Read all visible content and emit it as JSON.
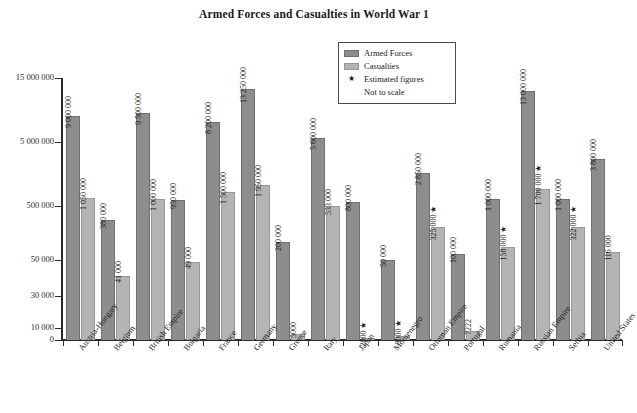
{
  "chart_data": {
    "type": "bar",
    "title": "Armed Forces and Casualties in World War 1",
    "xlabel": "",
    "ylabel": "",
    "grid": false,
    "legend_position": "top-center-right",
    "axis_note": "Not to scale",
    "y_ticks": [
      "0",
      "10 000",
      "30 000",
      "50 000",
      "500 000",
      "5 000 000",
      "15 000 000"
    ],
    "y_tick_values": [
      0,
      10000,
      30000,
      50000,
      500000,
      5000000,
      15000000
    ],
    "categories": [
      "Austria-Hungary",
      "Belgium",
      "British Empire",
      "Bulgaria",
      "France",
      "Germany",
      "Greece",
      "Italy",
      "Japan",
      "Montenegro",
      "Ottoman Empire",
      "Portugal",
      "Rumania",
      "Russian Empire",
      "Serbia",
      "United States"
    ],
    "series": [
      {
        "name": "Armed Forces",
        "color": "#8d8d8d",
        "values": [
          9000000,
          380000,
          9500000,
          950000,
          8200000,
          13250000,
          200000,
          5600000,
          800000,
          50000,
          2850000,
          100000,
          1000000,
          13000000,
          1000000,
          3800000
        ],
        "labels": [
          "9 000 000",
          "380 000",
          "9 500 000",
          "950 000",
          "8 200 000",
          "13 250 000",
          "200 000",
          "5 600 000",
          "800 000",
          "50 000",
          "2 850 000",
          "100 000",
          "1 000 000",
          "13 000 000",
          "1 000 000",
          "3 800 000"
        ],
        "estimated": [
          false,
          false,
          false,
          false,
          false,
          false,
          false,
          false,
          false,
          false,
          false,
          false,
          false,
          false,
          false,
          false
        ]
      },
      {
        "name": "Casualties",
        "color": "#b4b4b4",
        "values": [
          1050000,
          41000,
          1000000,
          49000,
          1500000,
          1950000,
          5000,
          533000,
          2000,
          3000,
          325000,
          7222,
          158000,
          1700000,
          322000,
          116000
        ],
        "labels": [
          "1 050 000",
          "41 000",
          "1 000 000",
          "49 000",
          "1 500 000",
          "1 950 000",
          "5000",
          "533 000",
          "2000",
          "3000",
          "325 000",
          "7222",
          "158 000",
          "1 700 000",
          "322 000",
          "116 000"
        ],
        "estimated": [
          false,
          false,
          false,
          false,
          false,
          false,
          false,
          false,
          true,
          true,
          true,
          false,
          true,
          true,
          true,
          false
        ]
      }
    ]
  },
  "legend": {
    "items": [
      {
        "label": "Armed Forces",
        "type": "swatch",
        "color": "#8d8d8d"
      },
      {
        "label": "Casualties",
        "type": "swatch",
        "color": "#b4b4b4"
      },
      {
        "label": "Estimated figures",
        "type": "star",
        "glyph": "★"
      },
      {
        "label": "Not to scale",
        "type": "note"
      }
    ]
  },
  "symbols": {
    "estimated_marker": "★"
  },
  "colors": {
    "armed_forces": "#8d8d8d",
    "casualties": "#b4b4b4",
    "axis": "#2b2b2b",
    "text": "#1a1a1a",
    "background": "#ffffff"
  },
  "bottom_caption": ""
}
